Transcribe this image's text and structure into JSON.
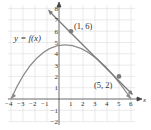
{
  "figure": {
    "curve_label": "y = f(x)",
    "points": [
      {
        "label": "(1, 6)",
        "x": 1,
        "y": 6
      },
      {
        "label": "(5, 2)",
        "x": 5,
        "y": 2
      }
    ],
    "x_axis_label": "x",
    "y_axis_label": "y",
    "x_ticks": [
      "−4",
      "−3",
      "−2",
      "−1",
      "1",
      "2",
      "3",
      "4",
      "5",
      "6"
    ],
    "y_ticks": [
      "−2",
      "−1",
      "1",
      "2",
      "3",
      "4",
      "5",
      "6",
      "7",
      "8"
    ],
    "colors": {
      "curve": "#8a8a8a",
      "grid": "#d8d8d8",
      "axis": "#444444",
      "point": "#7a7a7a"
    }
  }
}
